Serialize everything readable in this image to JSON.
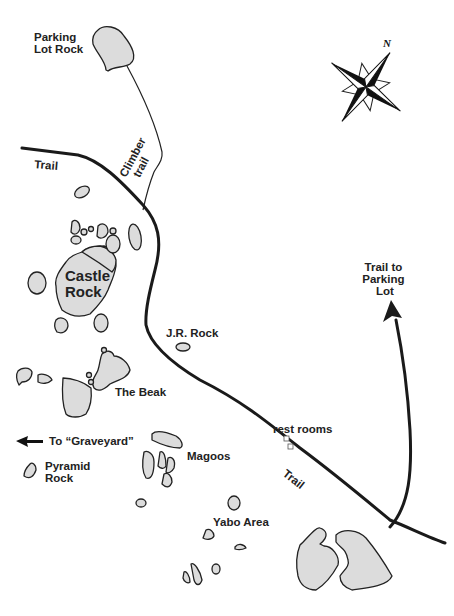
{
  "map": {
    "labels": {
      "parking_lot_rock": [
        "Parking",
        "Lot Rock"
      ],
      "trail_upper": "Trail",
      "climber_trail": [
        "Climber",
        "trail"
      ],
      "castle_rock": [
        "Castle",
        "Rock"
      ],
      "jr_rock": "J.R. Rock",
      "the_beak": "The Beak",
      "trail_to_parking_lot": [
        "Trail to",
        "Parking",
        "Lot"
      ],
      "to_graveyard": "To “Graveyard”",
      "pyramid_rock": [
        "Pyramid",
        "Rock"
      ],
      "magoos": "Magoos",
      "rest_rooms": "rest rooms",
      "trail_lower": "Trail",
      "yabo_area": "Yabo Area"
    },
    "compass": {
      "north_label": "N",
      "icon": "compass-rose-icon"
    },
    "colors": {
      "rock_fill": "#dcdcdc",
      "outline": "#222222",
      "background": "#ffffff"
    }
  }
}
